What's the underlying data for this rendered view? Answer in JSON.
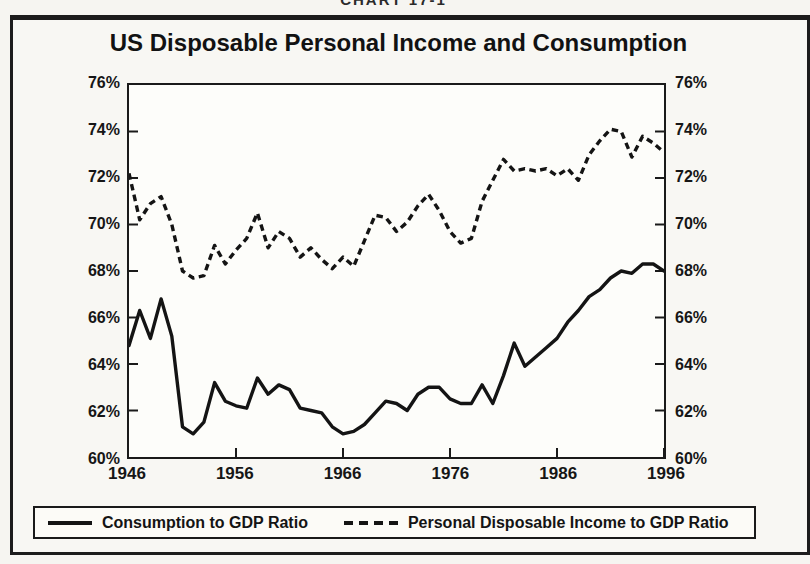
{
  "page": {
    "top_caption": "CHART 17-1",
    "title": "US Disposable Personal Income and Consumption"
  },
  "chart_data": {
    "type": "line",
    "title": "US Disposable Personal Income and Consumption",
    "xlim": [
      1946,
      1996
    ],
    "ylim": [
      60,
      76
    ],
    "grid": false,
    "legend_position": "bottom",
    "line_color": "#141414",
    "x_ticks": [
      1946,
      1956,
      1966,
      1976,
      1986,
      1996
    ],
    "y_ticks": [
      {
        "value": 76,
        "label": "76%"
      },
      {
        "value": 74,
        "label": "74%"
      },
      {
        "value": 72,
        "label": "72%"
      },
      {
        "value": 70,
        "label": "70%"
      },
      {
        "value": 68,
        "label": "68%"
      },
      {
        "value": 66,
        "label": "66%"
      },
      {
        "value": 64,
        "label": "64%"
      },
      {
        "value": 62,
        "label": "62%"
      },
      {
        "value": 60,
        "label": "60%"
      }
    ],
    "x": [
      1946,
      1947,
      1948,
      1949,
      1950,
      1951,
      1952,
      1953,
      1954,
      1955,
      1956,
      1957,
      1958,
      1959,
      1960,
      1961,
      1962,
      1963,
      1964,
      1965,
      1966,
      1967,
      1968,
      1969,
      1970,
      1971,
      1972,
      1973,
      1974,
      1975,
      1976,
      1977,
      1978,
      1979,
      1980,
      1981,
      1982,
      1983,
      1984,
      1985,
      1986,
      1987,
      1988,
      1989,
      1990,
      1991,
      1992,
      1993,
      1994,
      1995,
      1996
    ],
    "series": [
      {
        "name": "Consumption to GDP Ratio",
        "style": "solid",
        "values": [
          64.8,
          66.3,
          65.1,
          66.8,
          65.2,
          61.3,
          61.0,
          61.5,
          63.2,
          62.4,
          62.2,
          62.1,
          63.4,
          62.7,
          63.1,
          62.9,
          62.1,
          62.0,
          61.9,
          61.3,
          61.0,
          61.1,
          61.4,
          61.9,
          62.4,
          62.3,
          62.0,
          62.7,
          63.0,
          63.0,
          62.5,
          62.3,
          62.3,
          63.1,
          62.3,
          63.5,
          64.9,
          63.9,
          64.3,
          64.7,
          65.1,
          65.8,
          66.3,
          66.9,
          67.2,
          67.7,
          68.0,
          67.9,
          68.3,
          68.3,
          68.0
        ]
      },
      {
        "name": "Personal Disposable Income to GDP Ratio",
        "style": "dashed",
        "values": [
          72.2,
          70.2,
          70.9,
          71.2,
          70.0,
          68.0,
          67.7,
          67.8,
          69.1,
          68.3,
          68.9,
          69.4,
          70.5,
          69.0,
          69.7,
          69.4,
          68.6,
          69.0,
          68.5,
          68.1,
          68.6,
          68.2,
          69.3,
          70.4,
          70.3,
          69.7,
          70.1,
          70.8,
          71.3,
          70.6,
          69.7,
          69.2,
          69.4,
          71.0,
          71.9,
          72.8,
          72.3,
          72.4,
          72.3,
          72.4,
          72.1,
          72.4,
          71.9,
          73.0,
          73.6,
          74.1,
          74.0,
          72.9,
          73.8,
          73.5,
          73.1
        ]
      }
    ]
  },
  "legend": {
    "items": [
      {
        "label": "Consumption to GDP Ratio",
        "style": "solid"
      },
      {
        "label": "Personal Disposable Income to GDP Ratio",
        "style": "dashed"
      }
    ]
  }
}
